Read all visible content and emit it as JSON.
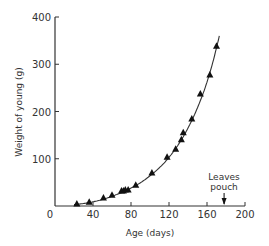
{
  "chart_data": {
    "type": "scatter",
    "title": "",
    "xlabel": "Age (days)",
    "ylabel": "Weight of young (g)",
    "xlim": [
      0,
      200
    ],
    "ylim": [
      0,
      400
    ],
    "xticks": [
      0,
      40,
      80,
      120,
      160,
      200
    ],
    "yticks": [
      100,
      200,
      300,
      400
    ],
    "grid": false,
    "legend": null,
    "series": [
      {
        "name": "Weight of young",
        "marker": "triangle",
        "points": [
          {
            "x": 23,
            "y": 4
          },
          {
            "x": 36,
            "y": 8
          },
          {
            "x": 51,
            "y": 17
          },
          {
            "x": 60,
            "y": 23
          },
          {
            "x": 70,
            "y": 32
          },
          {
            "x": 72,
            "y": 32
          },
          {
            "x": 74,
            "y": 34
          },
          {
            "x": 77,
            "y": 34
          },
          {
            "x": 85,
            "y": 44
          },
          {
            "x": 102,
            "y": 70
          },
          {
            "x": 118,
            "y": 103
          },
          {
            "x": 127,
            "y": 120
          },
          {
            "x": 133,
            "y": 140
          },
          {
            "x": 135,
            "y": 155
          },
          {
            "x": 144,
            "y": 184
          },
          {
            "x": 153,
            "y": 237
          },
          {
            "x": 163,
            "y": 277
          },
          {
            "x": 170,
            "y": 338
          }
        ]
      },
      {
        "name": "Fitted curve",
        "type": "line",
        "points": [
          {
            "x": 20,
            "y": 3
          },
          {
            "x": 40,
            "y": 9
          },
          {
            "x": 60,
            "y": 21
          },
          {
            "x": 80,
            "y": 38
          },
          {
            "x": 100,
            "y": 64
          },
          {
            "x": 120,
            "y": 103
          },
          {
            "x": 140,
            "y": 165
          },
          {
            "x": 160,
            "y": 262
          },
          {
            "x": 173,
            "y": 360
          }
        ]
      }
    ],
    "annotations": [
      {
        "text_lines": [
          "Leaves",
          "pouch"
        ],
        "x": 178,
        "arrow": "down"
      }
    ]
  },
  "labels": {
    "x_title": "Age (days)",
    "y_title": "Weight of young (g)",
    "anno_line1": "Leaves",
    "anno_line2": "pouch"
  }
}
